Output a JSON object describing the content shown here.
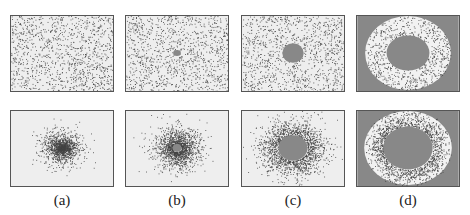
{
  "figure": {
    "columns": [
      {
        "label": "(a)",
        "x": 10,
        "top": {
          "hole_rx": 0,
          "hole_ry": 0,
          "outer": false
        },
        "bottom": {
          "mode": "blob",
          "hole_r": 0
        }
      },
      {
        "label": "(b)",
        "x": 125,
        "top": {
          "hole_rx": 4,
          "hole_ry": 3,
          "outer": false
        },
        "bottom": {
          "mode": "blob",
          "hole_r": 4
        }
      },
      {
        "label": "(c)",
        "x": 241,
        "top": {
          "hole_rx": 11,
          "hole_ry": 10,
          "outer": false
        },
        "bottom": {
          "mode": "blob",
          "hole_r": 13
        }
      },
      {
        "label": "(d)",
        "x": 356,
        "top": {
          "hole_rx": 22,
          "hole_ry": 18,
          "outer": true
        },
        "bottom": {
          "mode": "ring",
          "hole_r": 22
        }
      }
    ],
    "rows": {
      "top_y": 15,
      "bottom_y": 110
    },
    "colors": {
      "panel_bg": "#eeeeee",
      "dot": "#444444",
      "hole": "#888888",
      "border": "#555555"
    }
  }
}
